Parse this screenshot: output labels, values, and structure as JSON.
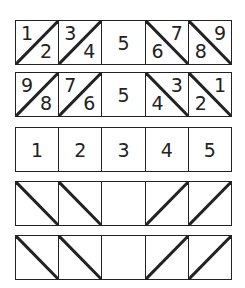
{
  "diagram": {
    "rows": [
      {
        "cells": [
          {
            "diagonal": "up",
            "a": "1",
            "b": "2"
          },
          {
            "diagonal": "up",
            "a": "3",
            "b": "4"
          },
          {
            "diagonal": "none",
            "center": "5"
          },
          {
            "diagonal": "down",
            "a": "7",
            "b": "6"
          },
          {
            "diagonal": "down",
            "a": "9",
            "b": "8"
          }
        ]
      },
      {
        "cells": [
          {
            "diagonal": "up",
            "a": "9",
            "b": "8"
          },
          {
            "diagonal": "up",
            "a": "7",
            "b": "6"
          },
          {
            "diagonal": "none",
            "center": "5"
          },
          {
            "diagonal": "down",
            "a": "3",
            "b": "4"
          },
          {
            "diagonal": "down",
            "a": "1",
            "b": "2"
          }
        ]
      },
      {
        "cells": [
          {
            "diagonal": "none",
            "center": "1"
          },
          {
            "diagonal": "none",
            "center": "2"
          },
          {
            "diagonal": "none",
            "center": "3"
          },
          {
            "diagonal": "none",
            "center": "4"
          },
          {
            "diagonal": "none",
            "center": "5"
          }
        ]
      },
      {
        "cells": [
          {
            "diagonal": "down"
          },
          {
            "diagonal": "down"
          },
          {
            "diagonal": "none"
          },
          {
            "diagonal": "up"
          },
          {
            "diagonal": "up"
          }
        ]
      },
      {
        "cells": [
          {
            "diagonal": "down"
          },
          {
            "diagonal": "down"
          },
          {
            "diagonal": "none"
          },
          {
            "diagonal": "up"
          },
          {
            "diagonal": "up"
          }
        ]
      }
    ],
    "colors": {
      "line": "#222222",
      "background": "#ffffff"
    }
  }
}
